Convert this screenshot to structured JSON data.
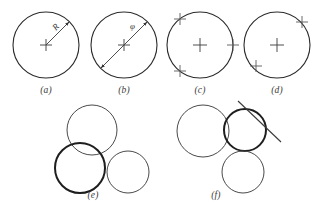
{
  "figure": {
    "width": 318,
    "height": 212,
    "background": "#ffffff",
    "stroke_color": "#2b2b2b",
    "stroke_color_light": "#4a4a4a",
    "thin_width": 1.0,
    "bold_width": 2.0,
    "artifact_text": "",
    "panels": [
      {
        "id": "a",
        "label": "(a)",
        "label_x": 46,
        "label_y": 93,
        "description": "circle with radius dimension",
        "circle": {
          "cx": 46,
          "cy": 45,
          "r": 33,
          "bold": false
        },
        "center_cross": {
          "x": 46,
          "y": 45,
          "size": 6
        },
        "dimension": {
          "kind": "radius",
          "symbol": "R",
          "symbol_x": 57,
          "symbol_y": 29,
          "symbol_rotation": -47,
          "from_x": 46,
          "from_y": 45,
          "to_x": 69,
          "to_y": 22,
          "arrow_at_end": true,
          "arrow_at_start": false
        },
        "edge_marks": []
      },
      {
        "id": "b",
        "label": "(b)",
        "label_x": 124,
        "label_y": 93,
        "description": "circle with diameter dimension",
        "circle": {
          "cx": 124,
          "cy": 45,
          "r": 33,
          "bold": false
        },
        "center_cross": {
          "x": 124,
          "y": 45,
          "size": 6
        },
        "dimension": {
          "kind": "diameter",
          "symbol": "φ",
          "symbol_x": 134,
          "symbol_y": 28,
          "symbol_rotation": 0,
          "from_x": 101,
          "from_y": 68,
          "to_x": 147,
          "to_y": 22,
          "arrow_at_end": true,
          "arrow_at_start": true
        },
        "edge_marks": []
      },
      {
        "id": "c",
        "label": "(c)",
        "label_x": 200,
        "label_y": 93,
        "description": "circle with three point marks on circumference",
        "circle": {
          "cx": 200,
          "cy": 45,
          "r": 33,
          "bold": false
        },
        "center_cross": {
          "x": 200,
          "y": 45,
          "size": 7
        },
        "dimension": null,
        "edge_marks": [
          {
            "x": 180,
            "y": 19,
            "size": 6
          },
          {
            "x": 233,
            "y": 45,
            "size": 6
          },
          {
            "x": 180,
            "y": 71,
            "size": 6
          }
        ]
      },
      {
        "id": "d",
        "label": "(d)",
        "label_x": 277,
        "label_y": 93,
        "description": "circle with two point marks on circumference",
        "circle": {
          "cx": 277,
          "cy": 45,
          "r": 33,
          "bold": false
        },
        "center_cross": {
          "x": 277,
          "y": 45,
          "size": 7
        },
        "dimension": null,
        "edge_marks": [
          {
            "x": 302,
            "y": 22,
            "size": 6
          },
          {
            "x": 256,
            "y": 66,
            "size": 6
          }
        ]
      },
      {
        "id": "e",
        "label": "(e)",
        "label_x": 93,
        "label_y": 199,
        "description": "three mutually tangent circles, lower-left circle emphasized",
        "circles": [
          {
            "cx": 92,
            "cy": 130,
            "r": 25,
            "bold": false
          },
          {
            "cx": 80,
            "cy": 168,
            "r": 25,
            "bold": true
          },
          {
            "cx": 128,
            "cy": 172,
            "r": 21,
            "bold": false
          }
        ]
      },
      {
        "id": "f",
        "label": "(f)",
        "label_x": 216,
        "label_y": 199,
        "description": "circle tangent to a line and to two other circles, tangent circle emphasized",
        "circles": [
          {
            "cx": 203,
            "cy": 131,
            "r": 26,
            "bold": false
          },
          {
            "cx": 245,
            "cy": 130,
            "r": 21,
            "bold": true
          },
          {
            "cx": 243,
            "cy": 172,
            "r": 21,
            "bold": false
          }
        ],
        "tangent_line": {
          "x1": 238,
          "y1": 101,
          "x2": 281,
          "y2": 142
        }
      }
    ]
  }
}
